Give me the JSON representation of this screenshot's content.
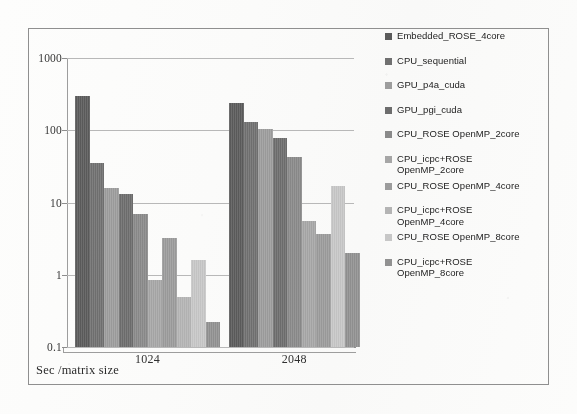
{
  "figure": {
    "axis_title": "Sec /matrix size"
  },
  "chart_data": {
    "type": "bar",
    "title": "",
    "subtitle": "",
    "xlabel": "Sec /matrix size",
    "ylabel": "",
    "yscale": "log",
    "ylim": [
      0.1,
      1000
    ],
    "yticks": [
      "0.1",
      "1",
      "10",
      "100",
      "1000"
    ],
    "ytick_values": [
      0.1,
      1,
      10,
      100,
      1000
    ],
    "grid": true,
    "legend_position": "right",
    "categories": [
      "1024",
      "2048"
    ],
    "series": [
      {
        "name": "Embedded_ROSE_4core",
        "color": "#5c5c5c",
        "values": [
          300,
          240
        ]
      },
      {
        "name": "CPU_sequential",
        "color": "#707070",
        "values": [
          35,
          130
        ]
      },
      {
        "name": "GPU_p4a_cuda",
        "color": "#9a9a9a",
        "values": [
          16,
          105
        ]
      },
      {
        "name": "GPU_pgi_cuda",
        "color": "#6d6d6d",
        "values": [
          13,
          78
        ]
      },
      {
        "name": "CPU_ROSE OpenMP_2core",
        "color": "#888888",
        "values": [
          7,
          42
        ]
      },
      {
        "name": "CPU_icpc+ROSE\nOpenMP_2core",
        "color": "#a3a3a3",
        "values": [
          0.85,
          5.5
        ]
      },
      {
        "name": "CPU_ROSE OpenMP_4core",
        "color": "#999999",
        "values": [
          3.2,
          3.7
        ]
      },
      {
        "name": "CPU_icpc+ROSE\nOpenMP_4core",
        "color": "#b0b0b0",
        "values": [
          0.5,
          null
        ]
      },
      {
        "name": "CPU_ROSE OpenMP_8core",
        "color": "#c2c2c2",
        "values": [
          1.6,
          17
        ]
      },
      {
        "name": "CPU_icpc+ROSE\nOpenMP_8core",
        "color": "#8f8f8f",
        "values": [
          0.22,
          2.0
        ]
      }
    ]
  },
  "legend": {
    "items": [
      {
        "label": "Embedded_ROSE_4core",
        "swatch": "#5c5c5c"
      },
      {
        "label": "CPU_sequential",
        "swatch": "#707070"
      },
      {
        "label": "GPU_p4a_cuda",
        "swatch": "#9a9a9a"
      },
      {
        "label": "GPU_pgi_cuda",
        "swatch": "#6d6d6d"
      },
      {
        "label": "CPU_ROSE OpenMP_2core",
        "swatch": "#888888"
      },
      {
        "label": "CPU_icpc+ROSE\nOpenMP_2core",
        "swatch": "#a3a3a3"
      },
      {
        "label": "CPU_ROSE OpenMP_4core",
        "swatch": "#999999"
      },
      {
        "label": "CPU_icpc+ROSE\nOpenMP_4core",
        "swatch": "#b0b0b0"
      },
      {
        "label": "CPU_ROSE OpenMP_8core",
        "swatch": "#c2c2c2"
      },
      {
        "label": "CPU_icpc+ROSE\nOpenMP_8core",
        "swatch": "#8f8f8f"
      }
    ]
  }
}
